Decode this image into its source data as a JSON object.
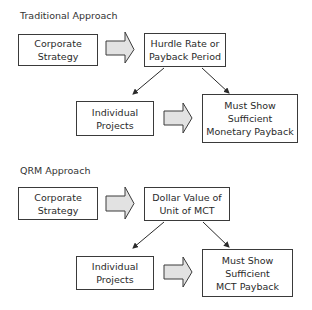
{
  "traditional": {
    "title": "Traditional Approach",
    "boxes": [
      {
        "label": "Corporate\nStrategy"
      },
      {
        "label": "Hurdle Rate or\nPayback Period"
      },
      {
        "label": "Individual\nProjects"
      },
      {
        "label": "Must Show\nSufficient\nMonetary Payback"
      }
    ]
  },
  "qrm": {
    "title": "QRM   Approach",
    "boxes": [
      {
        "label": "Corporate\nStrategy"
      },
      {
        "label": "Dollar Value of\nUnit of MCT"
      },
      {
        "label": "Individual\nProjects"
      },
      {
        "label": "Must Show\nSufficient\nMCT Payback"
      }
    ]
  },
  "colors": {
    "border": "#3a3a3a",
    "block_arrow_fill": "#e2e2e2",
    "text": "#2a2a2a"
  }
}
